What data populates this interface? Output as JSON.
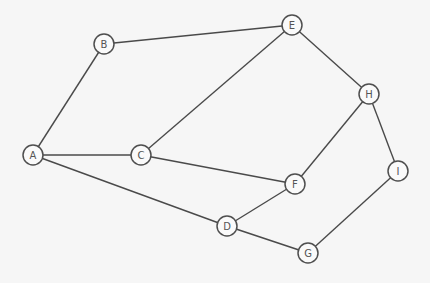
{
  "diagram": {
    "type": "undirected-graph",
    "colors": {
      "background": "#f6f6f6",
      "edge": "#4a4a4a",
      "node_stroke": "#4f4f4f",
      "node_fill": "#fafafa",
      "label": "#555555"
    },
    "node_radius": 10,
    "nodes": [
      {
        "id": "A",
        "label": "A",
        "x": 33,
        "y": 155
      },
      {
        "id": "B",
        "label": "B",
        "x": 104,
        "y": 44
      },
      {
        "id": "C",
        "label": "C",
        "x": 141,
        "y": 155
      },
      {
        "id": "D",
        "label": "D",
        "x": 227,
        "y": 226
      },
      {
        "id": "E",
        "label": "E",
        "x": 292,
        "y": 25
      },
      {
        "id": "F",
        "label": "F",
        "x": 295,
        "y": 184
      },
      {
        "id": "G",
        "label": "G",
        "x": 308,
        "y": 253
      },
      {
        "id": "H",
        "label": "H",
        "x": 369,
        "y": 94
      },
      {
        "id": "I",
        "label": "I",
        "x": 398,
        "y": 171
      }
    ],
    "edges": [
      [
        "A",
        "B"
      ],
      [
        "B",
        "E"
      ],
      [
        "A",
        "C"
      ],
      [
        "A",
        "D"
      ],
      [
        "C",
        "E"
      ],
      [
        "C",
        "F"
      ],
      [
        "E",
        "H"
      ],
      [
        "H",
        "F"
      ],
      [
        "H",
        "I"
      ],
      [
        "F",
        "D"
      ],
      [
        "D",
        "G"
      ],
      [
        "G",
        "I"
      ]
    ]
  }
}
